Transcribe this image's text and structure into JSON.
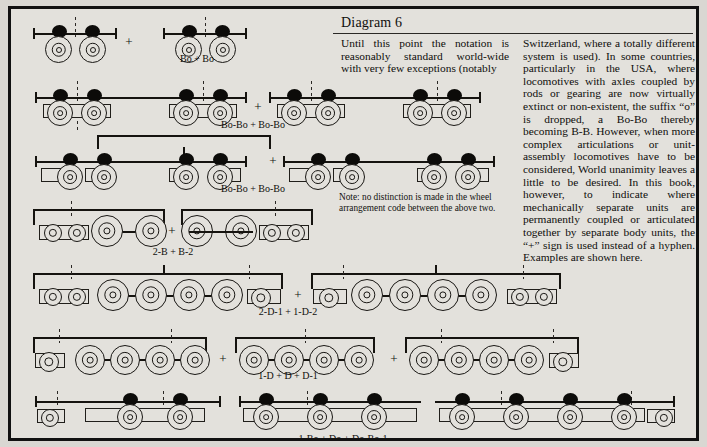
{
  "page": {
    "title": "Diagram 6",
    "background_color": "#e3e1dc",
    "border_color": "#111111",
    "ink_color": "#15130f"
  },
  "text": {
    "column_left": "Until this point the notation is reasonably standard world-wide with very few exceptions (notably",
    "column_right": "Switzerland, where a totally different system is used). In some countries, particularly in the USA, where locomotives with axles coupled by rods or gearing are now virtually extinct or non-existent, the suffix “o” is dropped, a Bo-Bo thereby becoming B-B. However, when more complex articulations or unit-assembly locomotives have to be considered, World unanimity leaves a little to be desired. In this book, however, to indicate where mechanically separate units are permanently coupled or articulated together by separate body units, the “+” sign is used instead of a hyphen. Examples are shown here.",
    "note": "Note: no distinction is made in the wheel arrangement code between the above two."
  },
  "diagram_rows": [
    {
      "id": "row-1",
      "label": "Bo + Bo",
      "label_x": 186,
      "label_y": 50,
      "plus_x": 118,
      "plus_y": 33
    },
    {
      "id": "row-2",
      "label": "Bo-Bo + Bo-Bo",
      "label_x": 242,
      "label_y": 116,
      "plus_x": 247,
      "plus_y": 98
    },
    {
      "id": "row-3",
      "label": "Bo-Bo + Bo-Bo",
      "label_x": 242,
      "label_y": 180,
      "plus_x": 262,
      "plus_y": 152
    },
    {
      "id": "row-4",
      "label": "2-B + B-2",
      "label_x": 162,
      "label_y": 243,
      "plus_x": 160,
      "plus_y": 219
    },
    {
      "id": "row-5",
      "label": "2-D-1 + 1-D-2",
      "label_x": 277,
      "label_y": 303,
      "plus_x": 287,
      "plus_y": 283
    },
    {
      "id": "row-6",
      "label": "1-D + D + D-1",
      "label_x": 277,
      "label_y": 367,
      "plus_x": 212,
      "plus_y": 347
    },
    {
      "id": "row-7",
      "label": "1-Bo + Do + Do-Bo-1",
      "label_x": 332,
      "label_y": 430,
      "plus_x": 0,
      "plus_y": 0
    }
  ],
  "extra_plus": [
    {
      "id": "plus-row6-b",
      "x": 383,
      "y": 347
    }
  ],
  "legend_meaning": {
    "filled-oval": "traction motor / powered axle marker",
    "concentric-circles": "driving wheel",
    "single-circle": "carrying (unpowered) wheel",
    "rectangle": "bogie / body frame",
    "horizontal-beam": "locomotive body",
    "dashed-vertical": "articulation centre line"
  }
}
